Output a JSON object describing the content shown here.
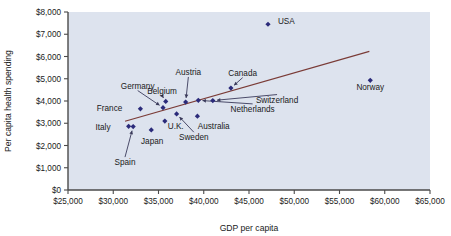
{
  "chart_data": {
    "type": "scatter",
    "title": "",
    "xlabel": "GDP per capita",
    "ylabel": "Per capita health spending",
    "xlim": [
      25000,
      65000
    ],
    "ylim": [
      0,
      8000
    ],
    "grid": false,
    "legend": "none",
    "plot_background": "#dde3ee",
    "marker_color": "#2b2b7a",
    "trendline_color": "#7a3b36",
    "x_ticks": [
      "$25,000",
      "$30,000",
      "$35,000",
      "$40,000",
      "$45,000",
      "$50,000",
      "$55,000",
      "$60,000",
      "$65,000"
    ],
    "x_tick_values": [
      25000,
      30000,
      35000,
      40000,
      45000,
      50000,
      55000,
      60000,
      65000
    ],
    "y_ticks": [
      "$0",
      "$1,000",
      "$2,000",
      "$3,000",
      "$4,000",
      "$5,000",
      "$6,000",
      "$7,000",
      "$8,000"
    ],
    "y_tick_values": [
      0,
      1000,
      2000,
      3000,
      4000,
      5000,
      6000,
      7000,
      8000
    ],
    "points": [
      {
        "name": "Italy",
        "x": 31700,
        "y": 2860,
        "label_x": 29700,
        "label_y": 2700,
        "label_anchor": "end",
        "leader": false
      },
      {
        "name": "Spain",
        "x": 32200,
        "y": 2850,
        "label_x": 31300,
        "label_y": 1120,
        "label_anchor": "middle",
        "leader": true
      },
      {
        "name": "Japan",
        "x": 34200,
        "y": 2700,
        "label_x": 34300,
        "label_y": 2050,
        "label_anchor": "middle",
        "leader": false
      },
      {
        "name": "France",
        "x": 33000,
        "y": 3650,
        "label_x": 31000,
        "label_y": 3560,
        "label_anchor": "end",
        "leader": false
      },
      {
        "name": "Germany",
        "x": 35500,
        "y": 3700,
        "label_x": 32700,
        "label_y": 4560,
        "label_anchor": "middle",
        "leader": true
      },
      {
        "name": "Belgium",
        "x": 35800,
        "y": 3980,
        "label_x": 35400,
        "label_y": 4330,
        "label_anchor": "middle",
        "leader": true
      },
      {
        "name": "U.K.",
        "x": 35700,
        "y": 3100,
        "label_x": 36900,
        "label_y": 2730,
        "label_anchor": "middle",
        "leader": false
      },
      {
        "name": "Sweden",
        "x": 37000,
        "y": 3420,
        "label_x": 38900,
        "label_y": 2240,
        "label_anchor": "middle",
        "leader": true
      },
      {
        "name": "Austria",
        "x": 38000,
        "y": 3950,
        "label_x": 38300,
        "label_y": 5170,
        "label_anchor": "middle",
        "leader": true
      },
      {
        "name": "Australia",
        "x": 39300,
        "y": 3320,
        "label_x": 41100,
        "label_y": 2760,
        "label_anchor": "middle",
        "leader": false
      },
      {
        "name": "Netherlands",
        "x": 39400,
        "y": 4030,
        "label_x": 45400,
        "label_y": 3510,
        "label_anchor": "middle",
        "leader": true
      },
      {
        "name": "Switzerland",
        "x": 41000,
        "y": 4020,
        "label_x": 48100,
        "label_y": 3930,
        "label_anchor": "middle",
        "leader": true
      },
      {
        "name": "Canada",
        "x": 43000,
        "y": 4580,
        "label_x": 44300,
        "label_y": 5140,
        "label_anchor": "middle",
        "leader": true
      },
      {
        "name": "USA",
        "x": 47100,
        "y": 7450,
        "label_x": 48200,
        "label_y": 7450,
        "label_anchor": "start",
        "leader": false
      },
      {
        "name": "Norway",
        "x": 58400,
        "y": 4930,
        "label_x": 58400,
        "label_y": 4480,
        "label_anchor": "middle",
        "leader": false
      }
    ],
    "trendline": {
      "x1": 31300,
      "y1": 3090,
      "x2": 58300,
      "y2": 6230
    }
  }
}
